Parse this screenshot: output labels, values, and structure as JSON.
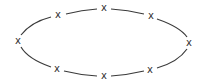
{
  "diagram": {
    "type": "cycle-ellipse",
    "edge_color": "#3a3a3a",
    "marker_color": "#333333",
    "nodes": [
      {
        "id": "n1",
        "label": "x",
        "x": 104,
        "y": 8
      },
      {
        "id": "n2",
        "label": "x",
        "x": 151,
        "y": 16
      },
      {
        "id": "n3",
        "label": "x",
        "x": 189,
        "y": 43
      },
      {
        "id": "n4",
        "label": "x",
        "x": 150,
        "y": 70
      },
      {
        "id": "n5",
        "label": "x",
        "x": 104,
        "y": 76
      },
      {
        "id": "n6",
        "label": "x",
        "x": 57,
        "y": 69
      },
      {
        "id": "n7",
        "label": "x",
        "x": 18,
        "y": 41
      },
      {
        "id": "n8",
        "label": "x",
        "x": 58,
        "y": 15
      }
    ]
  }
}
